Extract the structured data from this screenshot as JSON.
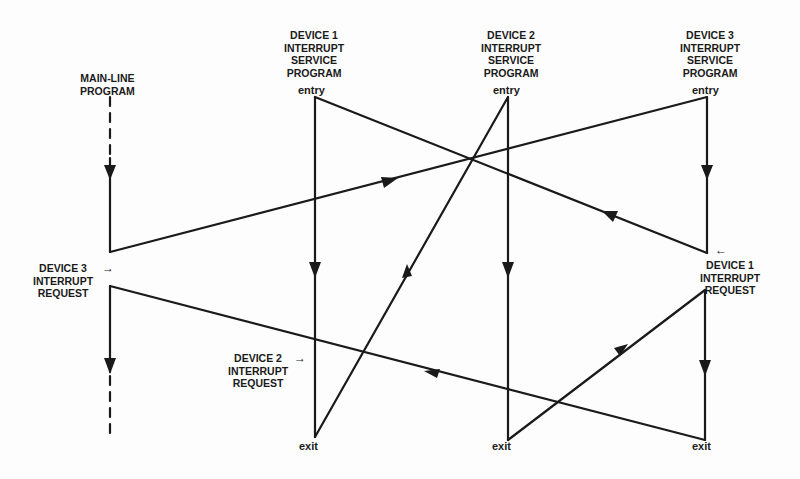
{
  "diagram": {
    "columns": {
      "main": {
        "label": [
          "MAIN-LINE",
          "PROGRAM"
        ]
      },
      "device1": {
        "label": [
          "DEVICE 1",
          "INTERRUPT",
          "SERVICE",
          "PROGRAM"
        ],
        "entry": "entry",
        "exit": "exit"
      },
      "device2": {
        "label": [
          "DEVICE 2",
          "INTERRUPT",
          "SERVICE",
          "PROGRAM"
        ],
        "entry": "entry",
        "exit": "exit"
      },
      "device3": {
        "label": [
          "DEVICE 3",
          "INTERRUPT",
          "SERVICE",
          "PROGRAM"
        ],
        "entry": "entry",
        "exit": "exit"
      }
    },
    "requests": {
      "device3": {
        "label": [
          "DEVICE 3",
          "INTERRUPT",
          "REQUEST"
        ],
        "arrow": "→"
      },
      "device2": {
        "label": [
          "DEVICE 2",
          "INTERRUPT",
          "REQUEST"
        ],
        "arrow": "→"
      },
      "device1": {
        "label": [
          "DEVICE 1",
          "INTERRUPT",
          "REQUEST"
        ],
        "arrow": "←"
      }
    },
    "line_color": "#1a1a1a",
    "flow": [
      "main-line runs until DEVICE 3 INTERRUPT REQUEST",
      "jump to DEVICE 3 service entry",
      "DEVICE 1 INTERRUPT REQUEST during device 3 service",
      "jump to DEVICE 1 service entry",
      "DEVICE 2 INTERRUPT REQUEST during device 1 service",
      "device 1 exit jumps to DEVICE 2 service entry",
      "device 2 exit returns to device 3 service",
      "device 3 exit returns to main-line program"
    ]
  }
}
